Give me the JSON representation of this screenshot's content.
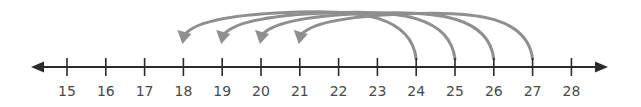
{
  "number_line": {
    "min": 15,
    "max": 28,
    "ticks": [
      "15",
      "16",
      "17",
      "18",
      "19",
      "20",
      "21",
      "22",
      "23",
      "24",
      "25",
      "26",
      "27",
      "28"
    ],
    "axis_color": "#2b2b2b",
    "arrows_both_ends": true
  },
  "jumps": [
    {
      "from": 24,
      "to": 18
    },
    {
      "from": 25,
      "to": 19
    },
    {
      "from": 26,
      "to": 20
    },
    {
      "from": 27,
      "to": 21
    }
  ],
  "jump_color": "#8f8f8f"
}
